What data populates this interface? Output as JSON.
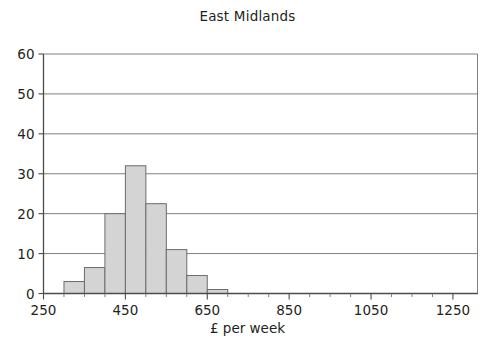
{
  "chart_data": {
    "type": "bar",
    "title": "East Midlands",
    "xlabel": "£ per week",
    "ylabel": "",
    "xlim": [
      250,
      1310
    ],
    "ylim": [
      0,
      60
    ],
    "grid": true,
    "legend": null,
    "xticks": [
      250,
      450,
      650,
      850,
      1050,
      1250
    ],
    "xtick_labels": [
      "250",
      "450",
      "650",
      "850",
      "1050",
      "1250"
    ],
    "yticks": [
      0,
      10,
      20,
      30,
      40,
      50,
      60
    ],
    "ytick_labels": [
      "0",
      "10",
      "20",
      "30",
      "40",
      "50",
      "60"
    ],
    "bin_width": 50,
    "bin_edges": [
      300,
      350,
      400,
      450,
      500,
      550,
      600,
      650,
      700
    ],
    "categories": [
      "300-350",
      "350-400",
      "400-450",
      "450-500",
      "500-550",
      "550-600",
      "600-650",
      "650-700"
    ],
    "values": [
      3,
      6.5,
      20,
      32,
      22.5,
      11,
      4.5,
      1
    ]
  },
  "chart": {
    "title": "East Midlands",
    "xlabel": "£ per week",
    "bar_fill_color": "#d4d4d4",
    "bar_stroke_color": "#6b6c6e",
    "gridline_color": "#6f7072",
    "axis_color": "#4a4b4d",
    "text_color": "#231f20"
  }
}
